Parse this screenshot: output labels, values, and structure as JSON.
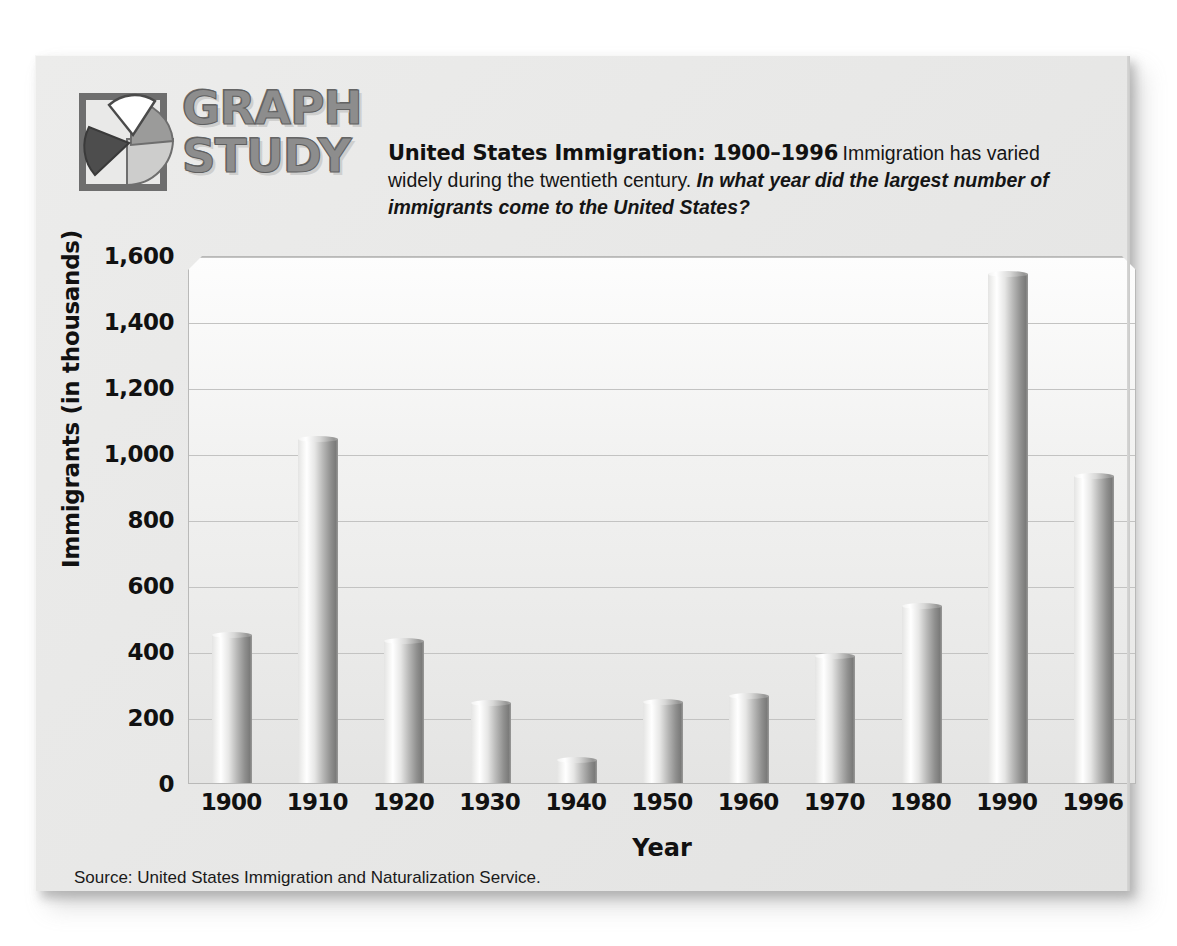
{
  "logo": {
    "line1": "GRAPH",
    "line2": "STUDY",
    "icon": "pie-chart-icon"
  },
  "header": {
    "headline": "United States Immigration: 1900–1996",
    "body_plain": "Immigration has varied widely during the twentieth century.",
    "body_question": "In what year did the largest number of immigrants come to the United States?"
  },
  "source": "Source: United States Immigration and Naturalization Service.",
  "chart_data": {
    "type": "bar",
    "title": "United States Immigration: 1900–1996",
    "xlabel": "Year",
    "ylabel": "Immigrants (in thousands)",
    "categories": [
      "1900",
      "1910",
      "1920",
      "1930",
      "1940",
      "1950",
      "1960",
      "1970",
      "1980",
      "1990",
      "1996"
    ],
    "values": [
      448,
      1041,
      430,
      241,
      71,
      245,
      265,
      386,
      535,
      1541,
      930
    ],
    "ylim": [
      0,
      1600
    ],
    "ytick_values": [
      0,
      200,
      400,
      600,
      800,
      1000,
      1200,
      1400,
      1600
    ],
    "ytick_labels": [
      "0",
      "200",
      "400",
      "600",
      "800",
      "1,000",
      "1,200",
      "1,400",
      "1,600"
    ],
    "grid": true,
    "legend": "none",
    "series": [
      {
        "name": "Immigrants (in thousands)",
        "values": [
          448,
          1041,
          430,
          241,
          71,
          245,
          265,
          386,
          535,
          1541,
          930
        ]
      }
    ]
  }
}
